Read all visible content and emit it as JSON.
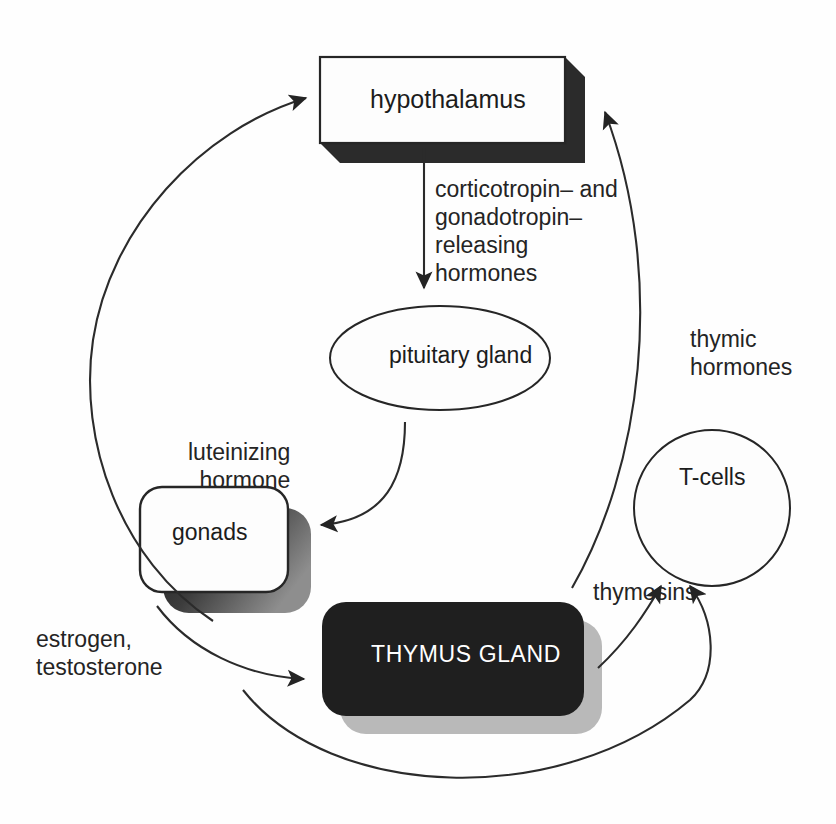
{
  "diagram": {
    "background_color": "#fefefe",
    "line_color": "#2b2b2b",
    "nodes": [
      {
        "id": "hypothalamus",
        "label": "hypothalamus",
        "shape": "rectangle-3d",
        "fill": "#ffffff",
        "shadow": "#2a2a2a"
      },
      {
        "id": "pituitary",
        "label": "pituitary gland",
        "shape": "ellipse-3d",
        "fill": "#ffffff",
        "shadow": "#2a2a2a"
      },
      {
        "id": "gonads",
        "label": "gonads",
        "shape": "rounded-rect-3d",
        "fill": "#ffffff",
        "shadow": "#3a3a3a"
      },
      {
        "id": "thymus",
        "label": "THYMUS GLAND",
        "shape": "rounded-rect-filled",
        "fill": "#1f1f1f",
        "text_color": "#ffffff",
        "shadow": "#b8b8b8"
      },
      {
        "id": "tcells",
        "label": "T-cells",
        "shape": "circle",
        "fill": "#ffffff",
        "shadow": "none"
      }
    ],
    "edges": [
      {
        "id": "hypothalamus-to-pituitary",
        "from": "hypothalamus",
        "to": "pituitary",
        "label": "corticotropin– and\ngonadotropin–\nreleasing\nhormones",
        "style": "straight-arrow"
      },
      {
        "id": "pituitary-to-gonads",
        "from": "pituitary",
        "to": "gonads",
        "label": "luteinizing\nhormone",
        "style": "curved-arrow"
      },
      {
        "id": "gonads-to-thymus",
        "from": "gonads",
        "to": "thymus",
        "label": "estrogen,\ntestosterone",
        "style": "curved-arrow"
      },
      {
        "id": "gonads-to-hypothalamus",
        "from": "gonads",
        "to": "hypothalamus",
        "label": "",
        "style": "long-curved-arrow"
      },
      {
        "id": "thymus-to-hypothalamus",
        "from": "thymus",
        "to": "hypothalamus",
        "label": "thymic\nhormones",
        "style": "long-curved-arrow"
      },
      {
        "id": "thymus-to-tcells-a",
        "from": "thymus",
        "to": "tcells",
        "label": "thymosins",
        "style": "curved-arrow"
      },
      {
        "id": "thymus-to-tcells-b",
        "from": "thymus",
        "to": "tcells",
        "label": "",
        "style": "curved-arrow"
      }
    ],
    "labels": {
      "releasing_hormones": "corticotropin– and\ngonadotropin–\nreleasing\nhormones",
      "luteinizing_hormone": "luteinizing\nhormone",
      "estrogen_testosterone": "estrogen,\ntestosterone",
      "thymic_hormones": "thymic\nhormones",
      "thymosins": "thymosins"
    }
  }
}
